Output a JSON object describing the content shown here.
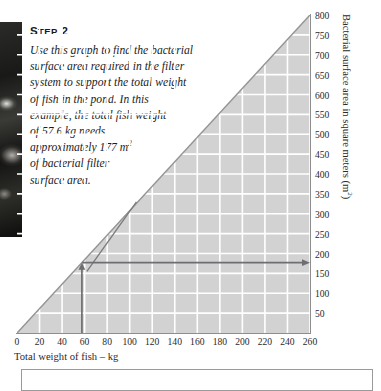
{
  "step": {
    "heading_prefix": "S",
    "heading_rest": "TEP",
    "heading_number": "2",
    "heading_full": "STEP 2",
    "body": "Use this graph to find the bacterial surface area required in the filter system to support the total weight of fish in the pond. In this example, the total fish weight of 57.6 kg needs approximately 177 m² of bacterial filter surface area."
  },
  "body_lines": {
    "l1": "Use this graph to find the bacterial",
    "l2": "surface area required in the filter",
    "l3": "system to support the total weight",
    "l4": "of fish in the pond. In this",
    "l5": "example, the total fish weight",
    "l6": "of 57.6 kg needs",
    "l7a": "approximately 177 m",
    "l7sup": "2",
    "l8": "of bacterial filter",
    "l9": "surface area."
  },
  "chart_data": {
    "type": "line",
    "title": "",
    "xlabel": "Total weight of fish – kg",
    "ylabel": "Bacterial surface area in square meters (m²)",
    "ylabel_main": "Bacterial surface area in square meters (m",
    "ylabel_sup": "2",
    "ylabel_tail": ")",
    "xlim": [
      0,
      260
    ],
    "ylim": [
      0,
      800
    ],
    "xticks": [
      0,
      20,
      40,
      60,
      80,
      100,
      120,
      140,
      160,
      180,
      200,
      220,
      240,
      260
    ],
    "yticks": [
      50,
      100,
      150,
      200,
      250,
      300,
      350,
      400,
      450,
      500,
      550,
      600,
      650,
      700,
      750,
      800
    ],
    "grid": true,
    "legend": "none",
    "series": [
      {
        "name": "Required bacterial surface area",
        "x": [
          0,
          260
        ],
        "y": [
          0,
          800
        ],
        "fill_below": true
      }
    ],
    "annotations": {
      "example_fish_weight_kg": 57.6,
      "example_surface_area_m2": 177,
      "vertical_arrow_x": 57.6,
      "vertical_arrow_from_y": 0,
      "vertical_arrow_to_y": 177,
      "horizontal_arrow_y": 177,
      "horizontal_arrow_from_x": 57.6,
      "horizontal_arrow_to_x": 260,
      "leader_line_from": [
        106,
        330
      ],
      "leader_line_to": [
        62,
        155
      ]
    }
  },
  "colors": {
    "fill": "#d0d0d0",
    "curve": "#8f8f8f",
    "grid": "#ffffff",
    "axis": "#8e8e8e",
    "arrow": "#6e6e72",
    "text": "#1c1c1e"
  }
}
